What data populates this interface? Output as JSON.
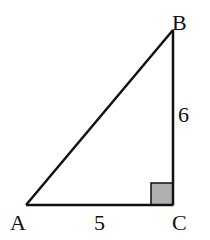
{
  "figure": {
    "type": "right-triangle",
    "vertices": {
      "A": {
        "label": "A",
        "x": 26,
        "y": 205
      },
      "B": {
        "label": "B",
        "x": 173,
        "y": 30
      },
      "C": {
        "label": "C",
        "x": 173,
        "y": 205
      }
    },
    "sides": {
      "AC": {
        "label": "5"
      },
      "BC": {
        "label": "6"
      }
    },
    "right_angle_at": "C",
    "colors": {
      "stroke": "#111111",
      "right_angle_fill": "#b0b0b0"
    }
  }
}
